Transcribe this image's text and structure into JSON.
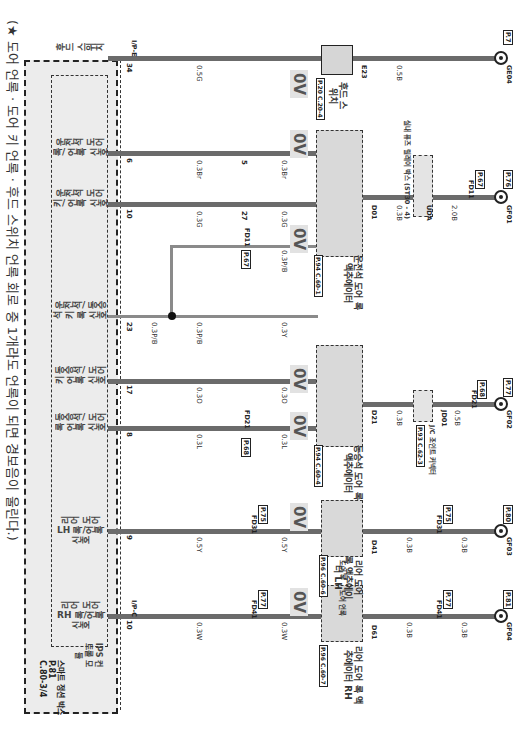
{
  "title": "(★ 도어 언록 · 도어 키 언록 · 후드 스위치 언록 회로 중 1개라도 언록이 되면 경보음이 울린다.)",
  "junction_box": {
    "label": "스마트 정션 박스",
    "code1": "P.81",
    "code2": "C.80-3/4",
    "ips_label": "IPS 컨트롤 모듈"
  },
  "voltage_label": "0V",
  "circuits": [
    {
      "id": "rear-rh",
      "signal": "리어 도어 RH 록/언록 신호",
      "pin": "10",
      "connector": "I/P-C",
      "gauge1": "0.3W",
      "mid_connector": "FD41",
      "mid_pin": "6",
      "mid_page": "P.77",
      "gauge2": "0.3W",
      "actuator": "리어 도어 록 액추에이터 RH",
      "actuator_ref": "P.96 C.60-7",
      "actuator_pin_in": "1",
      "actuator_conn": "D61",
      "actuator_pin_out": "2",
      "switch_labels": [
        "도어 언록",
        "도어 록"
      ],
      "gauge3": "0.3B",
      "mid2_connector": "FD41",
      "mid2_pin": "20",
      "mid2_page": "P.77",
      "gauge4": "0.3B",
      "ground": "GF04",
      "ground_page": "P.81"
    },
    {
      "id": "rear-lh",
      "signal": "리어 도어 LH 록/언록 신호",
      "pin": "9",
      "gauge1": "0.5Y",
      "mid_connector": "FD31",
      "mid_pin": "6",
      "mid_page": "P.75",
      "gauge2": "0.5Y",
      "actuator": "리어 도어 록 액추에이터 LH",
      "actuator_ref": "P.96 C.60-6",
      "actuator_pin_in": "1",
      "actuator_conn": "D41",
      "actuator_pin_out": "2",
      "switch_labels": [
        "도어 언록",
        "도어 록"
      ],
      "gauge3": "0.3B",
      "mid2_connector": "FD31",
      "mid2_pin": "20",
      "mid2_page": "P.75",
      "gauge4": "0.3B",
      "ground": "GF03",
      "ground_page": "P.80"
    },
    {
      "id": "passenger",
      "signal": "동승석/ 도어 록 언록 신호",
      "signal2": "동승석/ 도어 키 언록 신호",
      "pin": "8",
      "pin2": "17",
      "gauge1": "0.3L",
      "gauge1b": "0.3O",
      "mid_connector": "FD21",
      "mid_pin": "10",
      "mid_pin2": "7",
      "mid_page": "P.68",
      "gauge2": "0.3L",
      "gauge2b": "0.3O",
      "actuator": "동승석 도어 록 액추에이터",
      "actuator_ref": "P.94 C.60-4",
      "actuator_pin_in": "1",
      "actuator_conn": "D21",
      "actuator_pin_out": "6",
      "switch_labels": [
        "도어 언록",
        "도어 록",
        "키 록"
      ],
      "gauge3": "0.3B",
      "joint": "J/C 조인트 커넥터",
      "joint_conn": "JD01",
      "joint_ref": "P.93 C.62-3",
      "gauge4": "0.5B",
      "mid2_connector": "FD21",
      "mid2_pin": "44",
      "mid2_page": "P.68",
      "gauge5": "0.5B",
      "ground": "GF02",
      "ground_page": "P.77"
    },
    {
      "id": "driver-key",
      "signal": "운전석/ 동승석 키 록 신호",
      "pin": "23",
      "gauge1": "0.3P/B",
      "gauge1b": "0.3P/B",
      "mid_connector": "FD11",
      "mid_pin": "3",
      "mid_page": "P.67",
      "gauge2": "0.3P/B",
      "gauge2b": "0.3Y",
      "mid_pin_b": "26"
    },
    {
      "id": "driver",
      "signal": "운전석 도어 키/ 언록 신호",
      "signal2": "운전석 도어 록/ 언록 신호",
      "pin": "10",
      "pin2": "6",
      "gauge1": "0.3G",
      "gauge1b": "0.3Br",
      "mid_pin": "27",
      "mid_pin2": "5",
      "gauge2": "0.3G",
      "gauge2b": "0.3Br",
      "actuator": "운전석 도어 록 액추에이터",
      "actuator_ref": "P.94 C.60-1",
      "actuator_pin_in": "3",
      "actuator_conn": "D01",
      "actuator_pin_out": "2",
      "switch_labels": [
        "키 록",
        "키 언록",
        "도어 록",
        "도어 언록"
      ],
      "gauge3": "0.3B",
      "joint": "실내 퓨즈 릴레이 박스 (ST30 - 4)",
      "joint_conn": "UDA",
      "gauge4": "2.0B",
      "mid2_connector": "FD11",
      "mid2_pin": "2",
      "mid2_page": "P.67",
      "gauge5": "2.0B",
      "ground": "GF01",
      "ground_page": "P.76"
    },
    {
      "id": "hood",
      "signal": "후드 스위치",
      "pin": "34",
      "connector": "I/P-E",
      "gauge1": "0.5G",
      "switch": "후드 스위치",
      "switch_ref": "P.20 C.20-4",
      "switch_pin_in": "1",
      "switch_conn": "E23",
      "switch_pin_out": "2",
      "gauge2": "0.5B",
      "ground": "GE04",
      "ground_page": "P.7"
    }
  ]
}
